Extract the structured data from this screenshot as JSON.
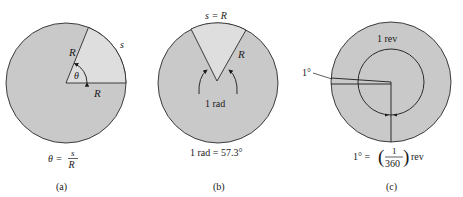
{
  "colors": {
    "circle_fill": "#c9c9c9",
    "sector_fill": "#dedede",
    "stroke": "#2a2a2a",
    "text": "#1a1a1a"
  },
  "panels": [
    {
      "id": "a",
      "caption": "(a)",
      "labels": {
        "radius_upper": "R",
        "radius_lower": "R",
        "arc": "s",
        "angle": "θ"
      },
      "formula": {
        "lhs": "θ =",
        "numerator": "s",
        "denominator": "R"
      }
    },
    {
      "id": "b",
      "caption": "(b)",
      "labels": {
        "arc": "s = R",
        "radius": "R",
        "angle": "1 rad"
      },
      "formula": {
        "text": "1 rad = 57.3°"
      }
    },
    {
      "id": "c",
      "caption": "(c)",
      "labels": {
        "inner": "1 rev",
        "pointer": "1°"
      },
      "formula": {
        "lhs": "1° =",
        "numerator": "1",
        "denominator": "360",
        "unit": "rev"
      }
    }
  ]
}
